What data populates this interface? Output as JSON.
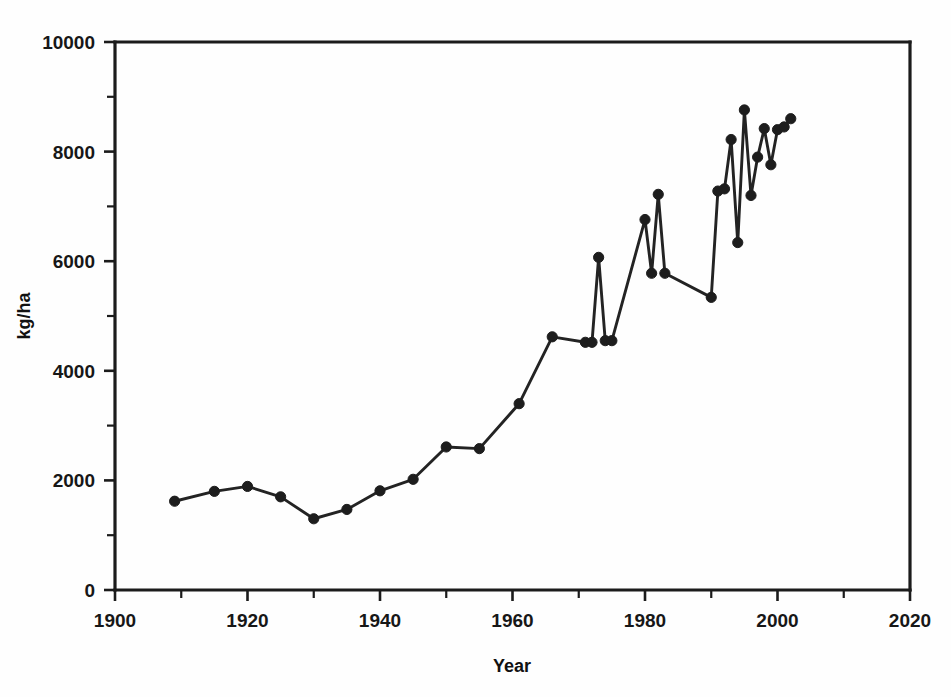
{
  "chart_data": {
    "type": "line",
    "title": "",
    "xlabel": "Year",
    "ylabel": "kg/ha",
    "xlim": [
      1900,
      2020
    ],
    "ylim": [
      0,
      10000
    ],
    "grid": false,
    "legend": null,
    "x_major_ticks": [
      1900,
      1920,
      1940,
      1960,
      1980,
      2000,
      2020
    ],
    "x_minor_ticks": [
      1910,
      1930,
      1950,
      1970,
      1990,
      2010
    ],
    "x_tick_labels": [
      "1900",
      "1920",
      "1940",
      "1960",
      "1980",
      "2000",
      "2020"
    ],
    "y_major_ticks": [
      0,
      2000,
      4000,
      6000,
      8000,
      10000
    ],
    "y_minor_ticks": [
      1000,
      3000,
      5000,
      7000,
      9000
    ],
    "y_tick_labels": [
      "0",
      "2000",
      "4000",
      "6000",
      "8000",
      "10000"
    ],
    "marker": "filled-circle",
    "x": [
      1909,
      1915,
      1920,
      1925,
      1930,
      1935,
      1940,
      1945,
      1950,
      1955,
      1961,
      1966,
      1971,
      1972,
      1973,
      1974,
      1975,
      1980,
      1981,
      1982,
      1983,
      1990,
      1991,
      1992,
      1993,
      1994,
      1995,
      1996,
      1997,
      1998,
      1999,
      2000,
      2001,
      2002
    ],
    "values": [
      1620,
      1800,
      1890,
      1700,
      1300,
      1470,
      1810,
      2020,
      2610,
      2580,
      3400,
      4620,
      4520,
      4520,
      6070,
      4550,
      4550,
      6760,
      5780,
      7220,
      5780,
      5340,
      7280,
      7320,
      8220,
      6340,
      8760,
      7200,
      7900,
      8420,
      7760,
      8400,
      8450,
      8600
    ],
    "series_name": "yield"
  },
  "axes": {
    "y_label": "kg/ha",
    "x_label": "Year"
  }
}
